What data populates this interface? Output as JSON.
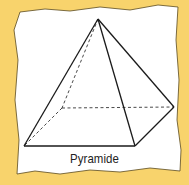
{
  "figure": {
    "caption": "Pyramide",
    "background_color": "#F8D36C",
    "paper_color": "#FFFFFF",
    "line_color": "#1A1A1A",
    "vertices": {
      "apex": [
        98,
        19
      ],
      "front_left": [
        24,
        146
      ],
      "front_right": [
        135,
        146
      ],
      "back_right": [
        174,
        107
      ],
      "back_left_hidden": [
        62,
        108
      ]
    }
  }
}
